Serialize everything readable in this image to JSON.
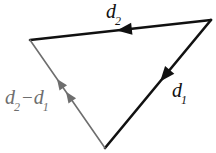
{
  "figure": {
    "type": "vector-triangle-diagram",
    "background_color": "#ffffff"
  },
  "labels": {
    "d2": {
      "base": "d",
      "sub": "2",
      "color": "#111111"
    },
    "d1": {
      "base": "d",
      "sub": "1",
      "color": "#111111"
    },
    "d2_minus_d1": {
      "base_first": "d",
      "sub_first": "2",
      "operator": "−",
      "base_second": "d",
      "sub_second": "1",
      "color": "#6e6e6e"
    }
  },
  "geometry": {
    "vertices": {
      "left": {
        "x": 30,
        "y": 40
      },
      "top_right": {
        "x": 211,
        "y": 20
      },
      "bottom": {
        "x": 105,
        "y": 148
      }
    },
    "edges": [
      {
        "name": "d2",
        "from": {
          "x": 211,
          "y": 20
        },
        "to": {
          "x": 30,
          "y": 40
        },
        "color": "#111111",
        "width": 2.6,
        "arrowheads": 1,
        "arrow_positions": [
          0.52
        ]
      },
      {
        "name": "d1",
        "from": {
          "x": 211,
          "y": 20
        },
        "to": {
          "x": 105,
          "y": 148
        },
        "color": "#111111",
        "width": 2.6,
        "arrowheads": 1,
        "arrow_positions": [
          0.48
        ]
      },
      {
        "name": "d2-minus-d1",
        "from": {
          "x": 105,
          "y": 148
        },
        "to": {
          "x": 30,
          "y": 40
        },
        "color": "#6e6e6e",
        "width": 1.6,
        "arrowheads": 2,
        "arrow_positions": [
          0.52,
          0.64
        ]
      }
    ]
  }
}
